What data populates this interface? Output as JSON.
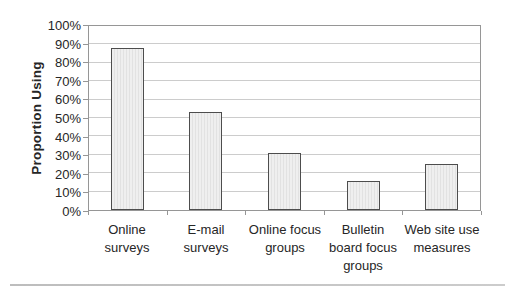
{
  "chart_data": {
    "type": "bar",
    "categories": [
      "Online surveys",
      "E-mail surveys",
      "Online focus groups",
      "Bulletin board focus groups",
      "Web site use measures"
    ],
    "values": [
      88,
      53,
      31,
      16,
      25
    ],
    "title": "",
    "xlabel": "",
    "ylabel": "Proportion Using",
    "ylim": [
      0,
      100
    ],
    "ytick_step": 10,
    "ytick_format": "percent",
    "grid": "horizontal",
    "legend": "none"
  },
  "colors": {
    "background": "#ffffff",
    "text": "#262626",
    "axis": "#969696",
    "gridline": "#cccccc",
    "bar_fill": "#efefef",
    "bar_stripe": "#e2e2e2",
    "bar_border": "#4d4d4d",
    "divider": "#cccccc"
  }
}
